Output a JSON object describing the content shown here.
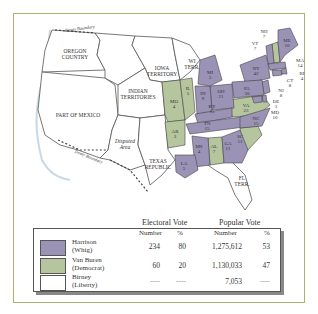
{
  "map": {
    "title": "Election of 1840",
    "colors": {
      "whig": "#9a93b5",
      "democrat": "#b5c59e",
      "none": "#ffffff",
      "frame": "#a9b36c",
      "water": "#dde6ec"
    },
    "region_labels": {
      "treaty_boundary_north": "Treaty Boundary",
      "oregon": [
        "OREGON",
        "COUNTRY"
      ],
      "iowa": [
        "IOWA",
        "TERRITORY"
      ],
      "wi": [
        "WI",
        "TERR."
      ],
      "indian": [
        "INDIAN",
        "TERRITORIES"
      ],
      "mexico": "PART OF MEXICO",
      "treaty_boundary_south": "Treaty Boundary",
      "disputed": [
        "Disputed",
        "Area"
      ],
      "texas": [
        "TEXAS",
        "REPUBLIC"
      ],
      "fl": [
        "FL",
        "TERR."
      ]
    },
    "states": [
      {
        "abbr": "ME",
        "ev": "10",
        "party": "whig"
      },
      {
        "abbr": "NH",
        "ev": "7",
        "party": "democrat"
      },
      {
        "abbr": "VT",
        "ev": "7",
        "party": "whig"
      },
      {
        "abbr": "MA",
        "ev": "14",
        "party": "whig"
      },
      {
        "abbr": "RI",
        "ev": "4",
        "party": "whig"
      },
      {
        "abbr": "CT",
        "ev": "8",
        "party": "whig"
      },
      {
        "abbr": "NY",
        "ev": "42",
        "party": "whig"
      },
      {
        "abbr": "NJ",
        "ev": "8",
        "party": "whig"
      },
      {
        "abbr": "PA",
        "ev": "30",
        "party": "whig"
      },
      {
        "abbr": "DE",
        "ev": "3",
        "party": "whig"
      },
      {
        "abbr": "MD",
        "ev": "10",
        "party": "whig"
      },
      {
        "abbr": "VA",
        "ev": "23",
        "party": "democrat"
      },
      {
        "abbr": "NC",
        "ev": "15",
        "party": "whig"
      },
      {
        "abbr": "SC",
        "ev": "11",
        "party": "democrat"
      },
      {
        "abbr": "GA",
        "ev": "11",
        "party": "whig"
      },
      {
        "abbr": "AL",
        "ev": "7",
        "party": "democrat"
      },
      {
        "abbr": "MS",
        "ev": "4",
        "party": "whig"
      },
      {
        "abbr": "LA",
        "ev": "5",
        "party": "whig"
      },
      {
        "abbr": "TN",
        "ev": "15",
        "party": "whig"
      },
      {
        "abbr": "KY",
        "ev": "15",
        "party": "whig"
      },
      {
        "abbr": "OH",
        "ev": "21",
        "party": "whig"
      },
      {
        "abbr": "IN",
        "ev": "9",
        "party": "whig"
      },
      {
        "abbr": "IL",
        "ev": "5",
        "party": "democrat"
      },
      {
        "abbr": "MI",
        "ev": "3",
        "party": "whig"
      },
      {
        "abbr": "MO",
        "ev": "4",
        "party": "democrat"
      },
      {
        "abbr": "AR",
        "ev": "3",
        "party": "democrat"
      }
    ]
  },
  "legend": {
    "header_electoral": "Electoral Vote",
    "header_popular": "Popular Vote",
    "col_number": "Number",
    "col_percent": "%",
    "rows": [
      {
        "name": "Harrison",
        "party": "(Whig)",
        "ev_number": "234",
        "ev_percent": "80",
        "pop_number": "1,275,612",
        "pop_percent": "53",
        "color": "#9a93b5"
      },
      {
        "name": "Van Buren",
        "party": "(Democrat)",
        "ev_number": "60",
        "ev_percent": "20",
        "pop_number": "1,130,033",
        "pop_percent": "47",
        "color": "#b5c59e"
      },
      {
        "name": "Birney",
        "party": "(Liberty)",
        "ev_number": "----",
        "ev_percent": "----",
        "pop_number": "7,053",
        "pop_percent": "----",
        "color": "#ffffff"
      }
    ]
  }
}
